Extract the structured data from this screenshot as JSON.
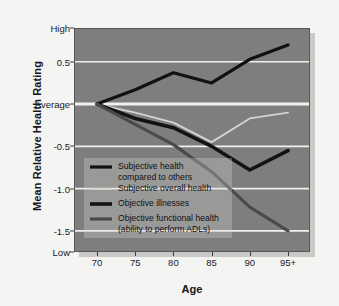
{
  "chart_data": {
    "type": "line",
    "title": "",
    "xlabel": "Age",
    "ylabel": "Mean Relative Health Rating",
    "categories": [
      "70",
      "75",
      "80",
      "85",
      "90",
      "95+"
    ],
    "x": [
      70,
      75,
      80,
      85,
      90,
      95
    ],
    "ylim": [
      -1.75,
      0.9
    ],
    "xlim": [
      70,
      95
    ],
    "grid": true,
    "gridlines": [
      0.5,
      0,
      -0.5,
      -1.0,
      -1.5
    ],
    "ytick_labels": [
      "High",
      "0.5",
      "Average",
      "-0.5",
      "-1.0",
      "-1.5",
      "Low"
    ],
    "ytick_values": [
      0.9,
      0.5,
      0,
      -0.5,
      -1.0,
      -1.5,
      -1.75
    ],
    "legend_position": "inside-lower-left",
    "series": [
      {
        "name": "Subjective health compared to others",
        "legend_label": "Subjective health\ncompared to others",
        "color": "#111114",
        "width": 3.2,
        "values": [
          0,
          0.17,
          0.37,
          0.25,
          0.53,
          0.7
        ]
      },
      {
        "name": "Subjective overall health",
        "legend_label": "Subjective overall health",
        "color": "#d3d3d0",
        "width": 1.8,
        "values": [
          0,
          -0.1,
          -0.22,
          -0.45,
          -0.17,
          -0.1
        ]
      },
      {
        "name": "Objective illnesses",
        "legend_label": "Objective illnesses",
        "color": "#131316",
        "width": 3.6,
        "values": [
          0,
          -0.17,
          -0.28,
          -0.5,
          -0.78,
          -0.55
        ]
      },
      {
        "name": "Objective functional health (ability to perform ADLs)",
        "legend_label": "Objective functional health\n(ability to perform ADLs)",
        "color": "#4a4a4e",
        "width": 3.2,
        "values": [
          0,
          -0.24,
          -0.48,
          -0.8,
          -1.22,
          -1.5
        ]
      }
    ]
  },
  "style": {
    "plot_background": "#7e7e7e",
    "gridline_color": "#f0f0ee",
    "axis_text_color": "#1a1a1f",
    "page_background": "#f4f4f2"
  }
}
